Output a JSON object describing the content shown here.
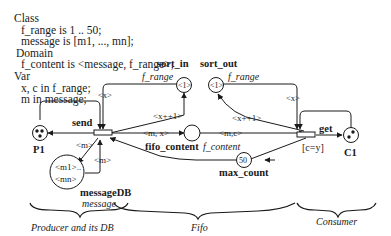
{
  "declarations": {
    "class_header": "Class",
    "class_lines": [
      "f_range is 1 .. 50;",
      "message is [m1, ..., mn];"
    ],
    "domain_header": "Domain",
    "domain_lines": [
      "f_content is <message, f_range>;"
    ],
    "var_header": "Var",
    "var_lines": [
      "x, c in f_range;",
      "m in message;"
    ]
  },
  "places": {
    "P1": {
      "name": "P1"
    },
    "C1": {
      "name": "C1"
    },
    "sort_in": {
      "name": "sort_in",
      "domain": "f_range",
      "marking": "<1>"
    },
    "sort_out": {
      "name": "sort_out",
      "domain": "f_range",
      "marking": "<1>"
    },
    "fifo_content": {
      "name": "fifo_content",
      "domain": "f_content"
    },
    "messageDB": {
      "name": "messageDB",
      "domain": "message",
      "marking_1": "<m1>..",
      "marking_2": "<mn>"
    },
    "max_count": {
      "name": "max_count",
      "marking": "50"
    }
  },
  "transitions": {
    "send": {
      "name": "send"
    },
    "get": {
      "name": "get",
      "guard": "[c=y]"
    }
  },
  "arcs": {
    "sort_in_to_send": "<x>",
    "send_to_sort_in": "<x++1>",
    "send_to_fifo": "<m, x>",
    "fifo_to_get": "<m,c>",
    "sort_out_to_get": "<x>",
    "get_to_sort_out": "<x++1>",
    "send_to_db": "<m>",
    "db_to_send": "<m>"
  },
  "sections": {
    "producer": "Producer and its DB",
    "fifo": "Fifo",
    "consumer": "Consumer"
  },
  "colors": {
    "ink": "#1a1a1a",
    "background": "#ffffff"
  }
}
